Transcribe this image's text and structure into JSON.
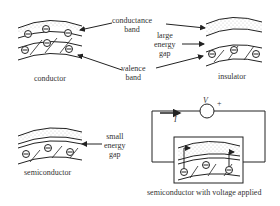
{
  "labels": {
    "conductance_band": "conductance\nband",
    "valence_band": "valence\nband",
    "large_energy_gap": "large\nenergy\ngap",
    "small_energy_gap": "small\nenergy\ngap",
    "conductor": "conductor",
    "insulator": "insulator",
    "semiconductor": "semiconductor",
    "semiconductor_voltage": "semiconductor with voltage applied",
    "voltage_symbol": "V",
    "plus_sign": "+",
    "current_symbol": "I"
  },
  "electron_symbol": "⊖",
  "colors": {
    "line": "#222222",
    "dots": "#bbbbbb",
    "background": "#ffffff"
  }
}
